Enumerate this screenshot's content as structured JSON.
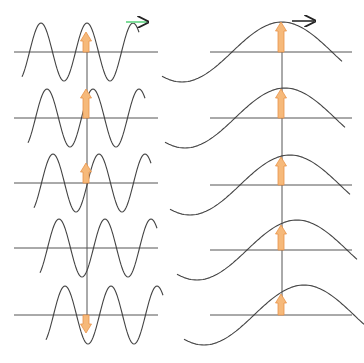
{
  "figure": {
    "colors": {
      "background": "#ffffff",
      "wave": "#444444",
      "axis": "#555555",
      "arrow_fill": "#f6b97a",
      "arrow_stroke": "#e8934a",
      "direction_arrow": "#7fdc9a",
      "direction_arrow_head": "#222222"
    },
    "left_column": {
      "label": "short-wavelength wave",
      "reference_x": 87,
      "axis_x_start": 14,
      "axis_x_end": 158,
      "wavelength": 46,
      "amplitude": 29,
      "rows": [
        {
          "axis_y": 52,
          "phase_shift": 0,
          "arrow": "up",
          "arrow_len": 20,
          "direction_arrow": true
        },
        {
          "axis_y": 118,
          "phase_shift": 6,
          "arrow": "up",
          "arrow_len": 29,
          "direction_arrow": false
        },
        {
          "axis_y": 183,
          "phase_shift": 12,
          "arrow": "up",
          "arrow_len": 20,
          "direction_arrow": false
        },
        {
          "axis_y": 248,
          "phase_shift": 18,
          "arrow": "none",
          "arrow_len": 0,
          "direction_arrow": false
        },
        {
          "axis_y": 315,
          "phase_shift": 24,
          "arrow": "down",
          "arrow_len": 18,
          "direction_arrow": false
        }
      ]
    },
    "right_column": {
      "label": "long-wavelength wave",
      "reference_x": 282,
      "axis_x_start": 210,
      "axis_x_end": 352,
      "wavelength": 200,
      "amplitude": 30,
      "rows": [
        {
          "axis_y": 52,
          "phase_shift": 0,
          "arrow": "up",
          "arrow_len": 30,
          "direction_arrow": true
        },
        {
          "axis_y": 118,
          "phase_shift": 3,
          "arrow": "up",
          "arrow_len": 29,
          "direction_arrow": false
        },
        {
          "axis_y": 185,
          "phase_shift": 8,
          "arrow": "up",
          "arrow_len": 28,
          "direction_arrow": false
        },
        {
          "axis_y": 250,
          "phase_shift": 15,
          "arrow": "up",
          "arrow_len": 25,
          "direction_arrow": false
        },
        {
          "axis_y": 315,
          "phase_shift": 22,
          "arrow": "up",
          "arrow_len": 21,
          "direction_arrow": false
        }
      ]
    }
  }
}
